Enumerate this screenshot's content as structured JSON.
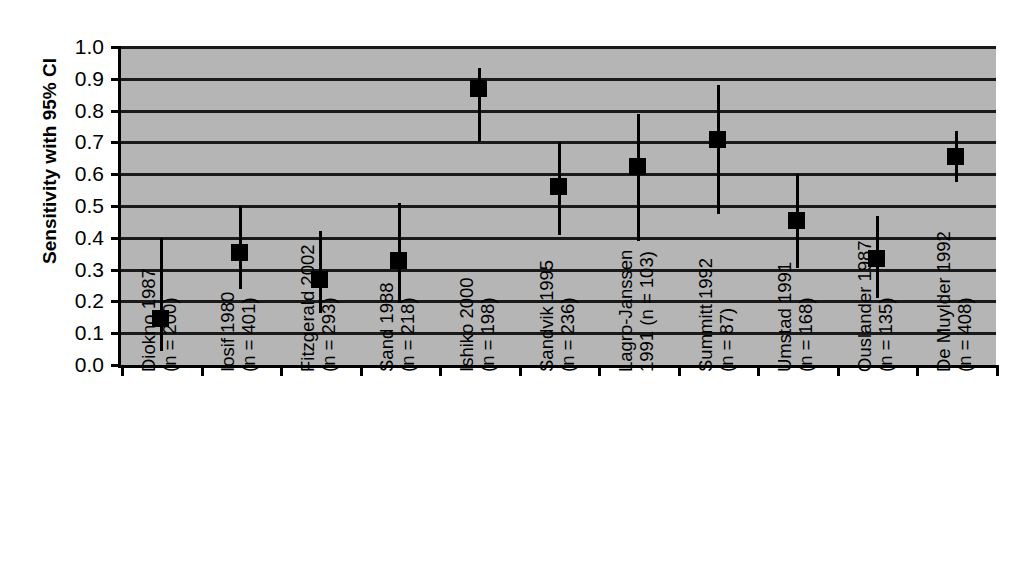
{
  "chart_data": {
    "type": "scatter",
    "title": "",
    "xlabel": "",
    "ylabel": "Sensitivity with 95% CI",
    "ylim": [
      0.0,
      1.0
    ],
    "grid": true,
    "legend": "none",
    "y_ticks": [
      "1.0",
      "0.9",
      "0.8",
      "0.7",
      "0.6",
      "0.5",
      "0.4",
      "0.3",
      "0.2",
      "0.1",
      "0.0"
    ],
    "y_tick_values": [
      1.0,
      0.9,
      0.8,
      0.7,
      0.6,
      0.5,
      0.4,
      0.3,
      0.2,
      0.1,
      0.0
    ],
    "categories": [
      "Diokno 1987\n(n = 200)",
      "Iosif 1980\n(n = 401)",
      "Fitzgerald 2002\n(n = 293)",
      "Sand 1988\n(n = 218)",
      "Ishiko 2000\n(n = 198)",
      "Sandvik 1995\n(n = 236)",
      "Lagro-Janssen\n1991 (n = 103)",
      "Summitt 1992\n(n = 87)",
      "Umstad 1991\n(n = 168)",
      "Ouslander 1987\n(n = 135)",
      "De Muylder 1992\n(n = 408)"
    ],
    "study_names": [
      "Diokno 1987",
      "Iosif 1980",
      "Fitzgerald 2002",
      "Sand 1988",
      "Ishiko 2000",
      "Sandvik 1995",
      "Lagro-Janssen 1991",
      "Summitt 1992",
      "Umstad 1991",
      "Ouslander 1987",
      "De Muylder 1992"
    ],
    "sample_sizes": [
      200,
      401,
      293,
      218,
      198,
      236,
      103,
      87,
      168,
      135,
      408
    ],
    "values": [
      0.145,
      0.355,
      0.27,
      0.33,
      0.87,
      0.56,
      0.625,
      0.71,
      0.455,
      0.335,
      0.655
    ],
    "ci_low": [
      0.045,
      0.24,
      0.165,
      0.195,
      0.7,
      0.41,
      0.39,
      0.475,
      0.305,
      0.21,
      0.575
    ],
    "ci_high": [
      0.4,
      0.5,
      0.42,
      0.51,
      0.935,
      0.7,
      0.79,
      0.88,
      0.6,
      0.47,
      0.735
    ],
    "colors": {
      "plot_background": "#b5b5b5",
      "page_background": "#ffffff",
      "marker": "#000000",
      "gridline": "#1a1a1a",
      "axis": "#000000",
      "text": "#000000"
    }
  }
}
